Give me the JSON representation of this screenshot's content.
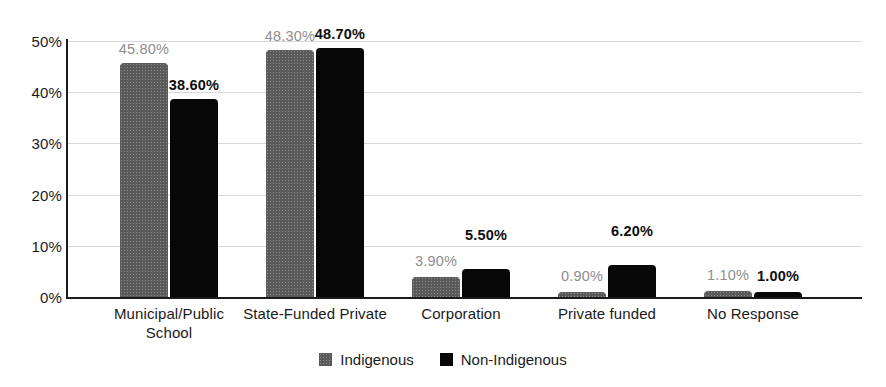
{
  "chart_data": {
    "type": "bar",
    "title": "",
    "subtitle": "",
    "xlabel": "",
    "ylabel": "",
    "ylim": [
      0,
      50
    ],
    "ytick_labels": [
      "0%",
      "10%",
      "20%",
      "30%",
      "40%",
      "50%"
    ],
    "ytick_values": [
      0,
      10,
      20,
      30,
      40,
      50
    ],
    "grid": true,
    "legend_position": "bottom-center",
    "value_suffix": "%",
    "categories": [
      "Municipal/Public\nSchool",
      "State-Funded Private",
      "Corporation",
      "Private funded",
      "No Response"
    ],
    "series": [
      {
        "name": "Indigenous",
        "color": "#5a5a5a",
        "values": [
          45.8,
          48.3,
          3.9,
          0.9,
          1.1
        ],
        "labels": [
          "45.80%",
          "48.30%",
          "3.90%",
          "0.90%",
          "1.10%"
        ]
      },
      {
        "name": "Non-Indigenous",
        "color": "#070707",
        "values": [
          38.6,
          48.7,
          5.5,
          6.2,
          1.0
        ],
        "labels": [
          "38.60%",
          "48.70%",
          "5.50%",
          "6.20%",
          "1.00%"
        ]
      }
    ]
  },
  "legend": {
    "items": [
      {
        "label": "Indigenous",
        "color": "#5a5a5a"
      },
      {
        "label": "Non-Indigenous",
        "color": "#070707"
      }
    ]
  },
  "axis": {
    "y_ticks": [
      {
        "label": "50%",
        "value": 50
      },
      {
        "label": "40%",
        "value": 40
      },
      {
        "label": "30%",
        "value": 30
      },
      {
        "label": "20%",
        "value": 20
      },
      {
        "label": "10%",
        "value": 10
      },
      {
        "label": "0%",
        "value": 0
      }
    ]
  }
}
